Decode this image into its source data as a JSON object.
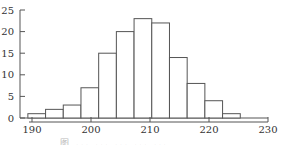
{
  "chart_data": {
    "type": "bar",
    "subtype": "histogram",
    "title": "",
    "xlabel": "",
    "ylabel": "",
    "bin_width": 3,
    "bins": [
      {
        "start": 189.5,
        "end": 192.5,
        "count": 1
      },
      {
        "start": 192.5,
        "end": 195.5,
        "count": 2
      },
      {
        "start": 195.5,
        "end": 198.5,
        "count": 3
      },
      {
        "start": 198.5,
        "end": 201.5,
        "count": 7
      },
      {
        "start": 201.5,
        "end": 204.5,
        "count": 15
      },
      {
        "start": 204.5,
        "end": 207.5,
        "count": 20
      },
      {
        "start": 207.5,
        "end": 210.5,
        "count": 23
      },
      {
        "start": 210.5,
        "end": 213.5,
        "count": 22
      },
      {
        "start": 213.5,
        "end": 216.5,
        "count": 14
      },
      {
        "start": 216.5,
        "end": 219.5,
        "count": 8
      },
      {
        "start": 219.5,
        "end": 222.5,
        "count": 4
      },
      {
        "start": 222.5,
        "end": 225.5,
        "count": 1
      }
    ],
    "categories": [
      "190.5-193.5",
      "193.5-196.5",
      "196.5-199.5",
      "199.5-202.5",
      "202.5-205.5",
      "205.5-208.5",
      "208.5-211.5",
      "211.5-214.5",
      "214.5-217.5",
      "217.5-220.5",
      "220.5-223.5",
      "223.5-226.5"
    ],
    "values": [
      1,
      2,
      3,
      7,
      15,
      20,
      23,
      22,
      14,
      8,
      4,
      1
    ],
    "x_ticks": [
      "190",
      "200",
      "210",
      "220",
      "230"
    ],
    "y_ticks": [
      "0",
      "5",
      "10",
      "15",
      "20",
      "25"
    ],
    "xlim": [
      188,
      231
    ],
    "ylim": [
      0,
      25
    ],
    "grid": false,
    "legend": null
  },
  "caption": "图 ... ... ... ... ..."
}
